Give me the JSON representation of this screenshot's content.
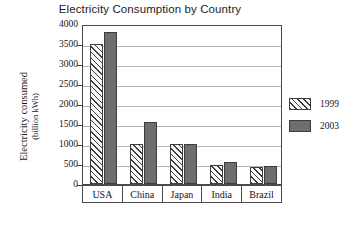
{
  "chart_data": {
    "type": "bar",
    "title": "Electricity Consumption by Country",
    "xlabel": "",
    "ylabel": "Electricity consumed",
    "ylabel_unit": "(billion kWh)",
    "categories": [
      "USA",
      "China",
      "Japan",
      "India",
      "Brazil"
    ],
    "series": [
      {
        "name": "1999",
        "values": [
          3500,
          1000,
          1000,
          470,
          430
        ],
        "pattern": "diagonal-hatch",
        "color": "#f2f2f2"
      },
      {
        "name": "2003",
        "values": [
          3800,
          1550,
          1000,
          560,
          440
        ],
        "pattern": "solid",
        "color": "#6e6e6e"
      }
    ],
    "ylim": [
      0,
      4000
    ],
    "yticks": [
      0,
      500,
      1000,
      1500,
      2000,
      2500,
      3000,
      3500,
      4000
    ],
    "grid": true,
    "legend_position": "right"
  }
}
